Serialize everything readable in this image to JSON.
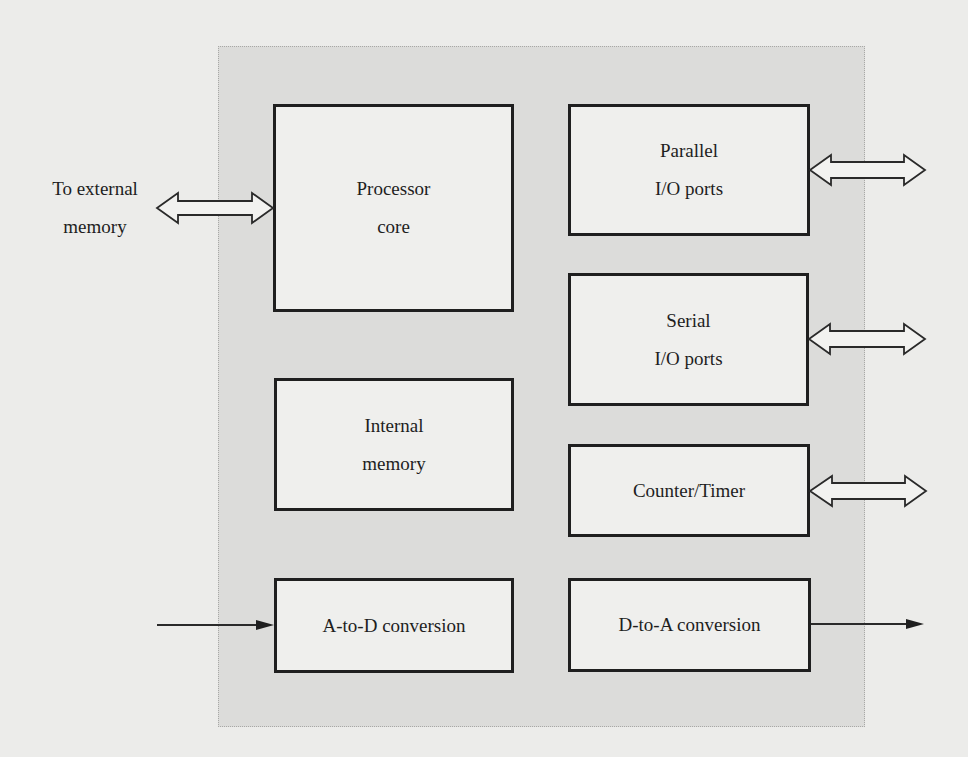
{
  "diagram": {
    "external_memory_label": "To external\nmemory",
    "blocks": {
      "processor_core": "Processor\ncore",
      "internal_memory": "Internal\nmemory",
      "a_to_d": "A-to-D conversion",
      "parallel_io": "Parallel\nI/O ports",
      "serial_io": "Serial\nI/O ports",
      "counter_timer": "Counter/Timer",
      "d_to_a": "D-to-A conversion"
    },
    "connections": [
      {
        "from": "external memory",
        "to": "Processor core",
        "type": "bidirectional-bus"
      },
      {
        "from": "Parallel I/O ports",
        "to": "external",
        "type": "bidirectional-bus"
      },
      {
        "from": "Serial I/O ports",
        "to": "external",
        "type": "bidirectional-bus"
      },
      {
        "from": "Counter/Timer",
        "to": "external",
        "type": "bidirectional-bus"
      },
      {
        "from": "external",
        "to": "A-to-D conversion",
        "type": "input-arrow"
      },
      {
        "from": "D-to-A conversion",
        "to": "external",
        "type": "output-arrow"
      }
    ],
    "colors": {
      "page": "#ececea",
      "chip_fill": "#dcdcda",
      "block_fill": "#efefed",
      "stroke": "#1f1f1f"
    }
  }
}
